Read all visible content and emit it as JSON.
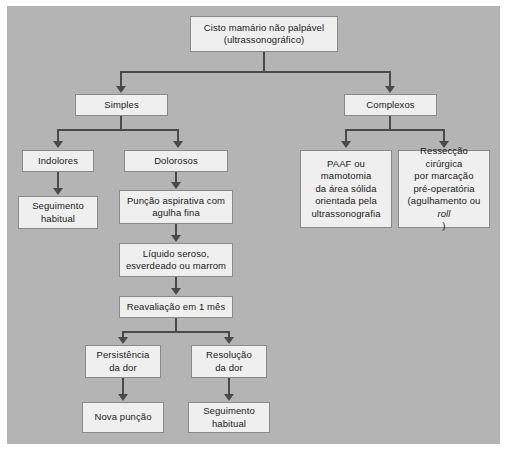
{
  "figure": {
    "kind": "clinical-flowchart",
    "language": "pt-BR",
    "panel_color": "#b4b4b4",
    "node_fill": "#efefef",
    "node_border": "#8a8a8a",
    "connector_color": "#4a4a4a"
  },
  "nodes": {
    "root": {
      "line1": "Cisto mamário não palpável",
      "line2": "(ultrassonográfico)"
    },
    "simples": {
      "line1": "Simples"
    },
    "complexos": {
      "line1": "Complexos"
    },
    "indolores": {
      "line1": "Indolores"
    },
    "dolorosos": {
      "line1": "Dolorosos"
    },
    "seguimento_habitual_1": {
      "line1": "Seguimento",
      "line2": "habitual"
    },
    "puncao_aspirativa": {
      "line1": "Punção aspirativa com",
      "line2": "agulha fina"
    },
    "liquido": {
      "line1": "Líquido seroso,",
      "line2": "esverdeado ou marrom"
    },
    "reavaliacao": {
      "line1": "Reavaliação em 1 mês"
    },
    "persistencia": {
      "line1": "Persistência",
      "line2": "da dor"
    },
    "resolucao": {
      "line1": "Resolução",
      "line2": "da dor"
    },
    "nova_puncao": {
      "line1": "Nova punção"
    },
    "seguimento_habitual_2": {
      "line1": "Seguimento",
      "line2": "habitual"
    },
    "paaf": {
      "line1": "PAAF ou mamotomia",
      "line2": "da área sólida",
      "line3": "orientada pela",
      "line4": "ultrassonografia"
    },
    "resseccao": {
      "line1": "Ressecção cirúrgica",
      "line2": "por marcação",
      "line3": "pré-operatória",
      "line4_pre": "(agulhamento ou ",
      "line4_italic": "roll",
      "line4_post": ")"
    }
  }
}
